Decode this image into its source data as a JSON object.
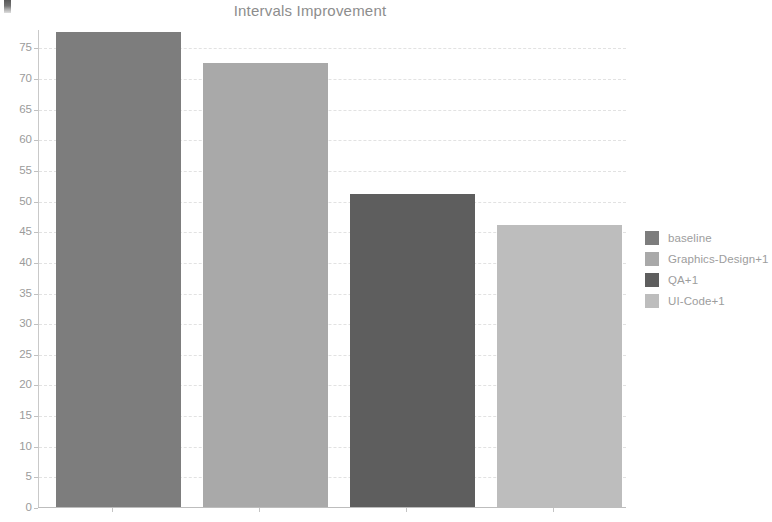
{
  "chart_data": {
    "type": "bar",
    "title": "Intervals Improvement",
    "xlabel": "",
    "ylabel": "",
    "categories": [
      "baseline",
      "Graphics-Design+1",
      "QA+1",
      "UI-Code+1"
    ],
    "values": [
      77.5,
      72.5,
      51.0,
      46.0
    ],
    "series": [
      {
        "name": "Intervals Improvement",
        "values": [
          77.5,
          72.5,
          51.0,
          46.0
        ]
      }
    ],
    "colors": [
      "#7d7d7d",
      "#a9a9a9",
      "#5e5e5e",
      "#bdbdbd"
    ],
    "ylim": [
      0,
      78
    ],
    "yticks": [
      0,
      5,
      10,
      15,
      20,
      25,
      30,
      35,
      40,
      45,
      50,
      55,
      60,
      65,
      70,
      75
    ],
    "ytick_labels": [
      "0",
      "5",
      "10",
      "15",
      "20",
      "25",
      "30",
      "35",
      "40",
      "45",
      "50",
      "55",
      "60",
      "65",
      "70",
      "75"
    ],
    "grid": true,
    "grid_axis": "y",
    "legend_position": "right",
    "legend": [
      {
        "label": "baseline",
        "color": "#7d7d7d"
      },
      {
        "label": "Graphics-Design+1",
        "color": "#a9a9a9"
      },
      {
        "label": "QA+1",
        "color": "#5e5e5e"
      },
      {
        "label": "UI-Code+1",
        "color": "#bdbdbd"
      }
    ]
  }
}
